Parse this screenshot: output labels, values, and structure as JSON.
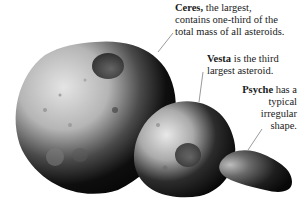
{
  "figure": {
    "asteroids": [
      {
        "name": "Ceres",
        "caption_bold": "Ceres,",
        "caption_rest": " the largest, contains one-third of the total mass of all asteroids.",
        "caption_lines": [
          "the largest,",
          "contains one-third of the",
          "total mass of all asteroids."
        ]
      },
      {
        "name": "Vesta",
        "caption_bold": "Vesta",
        "caption_rest": " is the third largest asteroid.",
        "caption_lines": [
          "is the third",
          "largest asteroid."
        ]
      },
      {
        "name": "Psyche",
        "caption_bold": "Psyche",
        "caption_rest": " has a typical irregular shape.",
        "caption_lines": [
          "has a",
          "typical",
          "irregular",
          "shape."
        ]
      }
    ]
  },
  "colors": {
    "background": "#ffffff",
    "text": "#1a1a1a",
    "leader_line": "#555555",
    "rock_light": "#d8d8d8",
    "rock_dark": "#0a0a0a"
  }
}
